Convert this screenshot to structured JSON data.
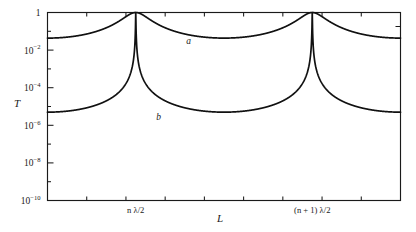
{
  "chart_data": {
    "type": "line",
    "title": "",
    "subtitle": "",
    "xlabel": "L",
    "ylabel": "T",
    "yscale": "log",
    "ylim": [
      1e-10,
      1.0
    ],
    "xlim": [
      0,
      2.0
    ],
    "grid": false,
    "legend_position": "inline-annotations",
    "y_ticks": [
      {
        "value": 1,
        "label": "1",
        "mantissa": "1",
        "exponent": ""
      },
      {
        "value": 0.01,
        "label": "10⁻²",
        "mantissa": "10",
        "exponent": "−2"
      },
      {
        "value": 0.0001,
        "label": "10⁻⁴",
        "mantissa": "10",
        "exponent": "−4"
      },
      {
        "value": 1e-06,
        "label": "10⁻⁶",
        "mantissa": "10",
        "exponent": "−6"
      },
      {
        "value": 1e-08,
        "label": "10⁻⁸",
        "mantissa": "10",
        "exponent": "−8"
      },
      {
        "value": 1e-10,
        "label": "10⁻¹⁰",
        "mantissa": "10",
        "exponent": "−10"
      }
    ],
    "x_ticks": [
      {
        "value": 0.5,
        "label": "n λ/2"
      },
      {
        "value": 1.5,
        "label": "(n + 1) λ/2"
      }
    ],
    "x_minor_tick_count": 8,
    "series": [
      {
        "name": "a",
        "label": "a",
        "description": "low-finesse Airy transmission, baseline minimum near 2×10⁻³",
        "annotation_label": "a",
        "peak_value": 1.0,
        "min_value": 0.002,
        "finesse_parameter": 22,
        "peaks_at": [
          "n λ/2",
          "(n + 1) λ/2"
        ],
        "color": "#111111"
      },
      {
        "name": "b",
        "label": "b",
        "description": "high-finesse Airy transmission, baseline minimum near 1×10⁻¹⁰",
        "annotation_label": "b",
        "peak_value": 1.0,
        "min_value": 1e-10,
        "finesse_parameter": 200000,
        "peaks_at": [
          "n λ/2",
          "(n + 1) λ/2"
        ],
        "color": "#111111"
      }
    ],
    "annotations": [
      {
        "text": "a",
        "series": "a",
        "x_frac": 0.4,
        "y_value": 0.02
      },
      {
        "text": "b",
        "series": "b",
        "x_frac": 0.315,
        "y_value": 2e-06
      }
    ]
  },
  "axes": {
    "y_axis_title": "T",
    "x_axis_title": "L"
  },
  "colors": {
    "background": "#ffffff",
    "ink": "#1a1a1a",
    "curve": "#111111"
  }
}
